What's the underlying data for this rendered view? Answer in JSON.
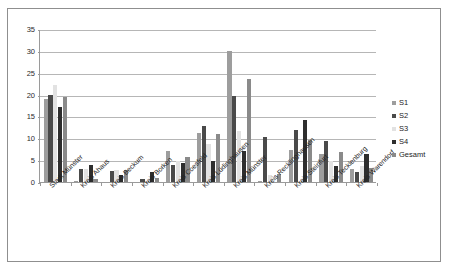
{
  "figure": {
    "frame_color": "#8f8f8f",
    "background": "#ffffff"
  },
  "chart_data": {
    "type": "bar",
    "title": "",
    "subtitle": "",
    "xlabel": "",
    "ylabel": "",
    "ylim": [
      0,
      35
    ],
    "ytick_step": 5,
    "yticks": [
      "0",
      "5",
      "10",
      "15",
      "20",
      "25",
      "30",
      "35"
    ],
    "grid": true,
    "grid_axis": "y",
    "legend_position": "right",
    "categories": [
      "Stadt Münster",
      "Kreis Ahaus",
      "Kreis Beckum",
      "Kreis Borken",
      "Kreis Coesfeld",
      "Kreis Lüdinghausen",
      "Kreis Münster",
      "Kreis Recklinghausen",
      "Kreis Steinfurt",
      "Kreis Tecklenburg",
      "Kreis Warendorf"
    ],
    "series": [
      {
        "name": "S1",
        "color": "#9d9d9d",
        "values": [
          19.0,
          0.2,
          0.0,
          0.0,
          7.0,
          11.2,
          30.0,
          0.2,
          7.4,
          6.5,
          2.9
        ]
      },
      {
        "name": "S2",
        "color": "#4a4a4a",
        "values": [
          20.0,
          3.0,
          2.6,
          0.8,
          4.0,
          12.9,
          19.6,
          10.3,
          12.0,
          9.3,
          2.2
        ]
      },
      {
        "name": "S3",
        "color": "#e2e2e2",
        "values": [
          22.2,
          2.9,
          2.8,
          0.3,
          4.9,
          8.7,
          11.6,
          1.7,
          0.0,
          4.9,
          3.7
        ]
      },
      {
        "name": "S4",
        "color": "#2e2e2e",
        "values": [
          17.2,
          3.9,
          1.6,
          2.2,
          4.3,
          4.7,
          7.1,
          0.0,
          14.1,
          3.7,
          6.5
        ]
      },
      {
        "name": "Gesamt",
        "color": "#8a8a8a",
        "values": [
          19.4,
          0.8,
          2.7,
          0.9,
          5.7,
          11.0,
          23.5,
          1.8,
          9.6,
          6.8,
          3.1
        ]
      }
    ]
  },
  "legend": {
    "entries": [
      {
        "label": "S1",
        "color": "#9d9d9d"
      },
      {
        "label": "S2",
        "color": "#4a4a4a"
      },
      {
        "label": "S3",
        "color": "#e2e2e2"
      },
      {
        "label": "S4",
        "color": "#2e2e2e"
      },
      {
        "label": "Gesamt",
        "color": "#8a8a8a"
      }
    ]
  }
}
